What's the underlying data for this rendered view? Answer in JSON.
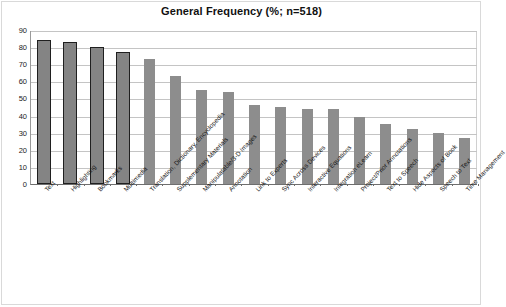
{
  "chart_data": {
    "type": "bar",
    "title": "General Frequency (%; n=518)",
    "xlabel": "",
    "ylabel": "",
    "ylim": [
      0,
      90
    ],
    "ytick_step": 10,
    "yticks": [
      90,
      80,
      70,
      60,
      50,
      40,
      30,
      20,
      10,
      0
    ],
    "grid": true,
    "legend": "none",
    "categories": [
      "Text",
      "Highlighting",
      "Bookmarks",
      "Multimedia",
      "Translation, Dictionary, Encyclopedia",
      "Supplementary Materials",
      "Manipulatable/3-D Images",
      "Annotation",
      "Link to Experts",
      "Sync Across Devices",
      "Interactive Equations",
      "Integration eLearn",
      "Project/Prior Annotations",
      "Text to Speech",
      "Hide Aspects of Book",
      "Speech to Text",
      "Time Management"
    ],
    "values": [
      84,
      83,
      80,
      77,
      73,
      63,
      55,
      54,
      46,
      45,
      44,
      44,
      39,
      35,
      32,
      30,
      27
    ],
    "series_name": "General Frequency",
    "bar_colors": {
      "primary": "#848484",
      "primary_outline": "#1f1f1f",
      "secondary": "#8d8d8d"
    },
    "highlighted_count": 4
  },
  "colors": {
    "background": "#ffffff",
    "grid": "#c4c4c4",
    "axis": "#6e6e6e",
    "text": "#1a1a1a"
  }
}
